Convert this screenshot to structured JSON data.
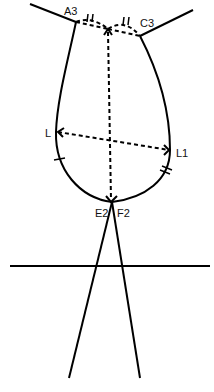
{
  "diagram": {
    "type": "pattern-draft",
    "stroke_color": "#000000",
    "background": "#ffffff",
    "labels": {
      "a3": "A3",
      "c3": "C3",
      "l": "L",
      "l1": "L1",
      "e2": "E2",
      "f2": "F2"
    },
    "points": {
      "A3": [
        76,
        22
      ],
      "C3": [
        140,
        36
      ],
      "top_center": [
        108,
        29
      ],
      "L": [
        57,
        132
      ],
      "L1": [
        170,
        150
      ],
      "E2F2": [
        112,
        202
      ]
    }
  }
}
